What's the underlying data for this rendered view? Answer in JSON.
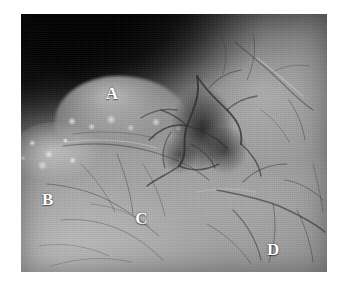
{
  "figure": {
    "type": "grayscale-photograph",
    "background_color": "#ffffff",
    "photo_border_color": "#8f8f8f",
    "label_color": "#ffffff",
    "labels": [
      {
        "id": "label-a",
        "text": "A",
        "x_pct": 27.7,
        "y_pct": 27.5
      },
      {
        "id": "label-b",
        "text": "B",
        "x_pct": 6.9,
        "y_pct": 68.6
      },
      {
        "id": "label-c",
        "text": "C",
        "x_pct": 37.3,
        "y_pct": 76.0
      },
      {
        "id": "label-d",
        "text": "D",
        "x_pct": 80.4,
        "y_pct": 88.0
      }
    ]
  }
}
